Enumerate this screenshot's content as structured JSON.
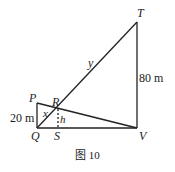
{
  "diagram": {
    "caption": "图 10",
    "points": {
      "P": {
        "label": "P",
        "x": 37,
        "y": 103
      },
      "Q": {
        "label": "Q",
        "x": 37,
        "y": 128
      },
      "R": {
        "label": "R",
        "x": 58,
        "y": 109
      },
      "S": {
        "label": "S",
        "x": 58,
        "y": 128
      },
      "T": {
        "label": "T",
        "x": 137,
        "y": 22
      },
      "V": {
        "label": "V",
        "x": 137,
        "y": 128
      }
    },
    "segment_labels": {
      "PQ": "20 m",
      "TV": "80 m",
      "QR": "x",
      "RT": "y",
      "RS": "h"
    },
    "line_color": "#222222"
  }
}
